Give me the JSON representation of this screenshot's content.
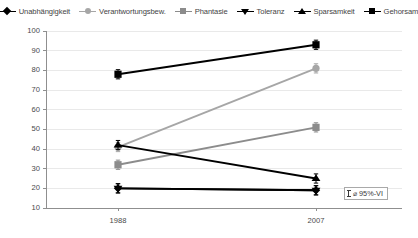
{
  "chart_data": {
    "type": "line",
    "title": "",
    "xlabel": "",
    "ylabel": "",
    "categories": [
      "1988",
      "2007"
    ],
    "ylim": [
      10,
      100
    ],
    "yticks": [
      100,
      90,
      80,
      70,
      60,
      50,
      40,
      30,
      20,
      10
    ],
    "grid": true,
    "legend_position": "top",
    "series": [
      {
        "name": "Unabhängigkeit",
        "marker": "diamond",
        "color": "#000000",
        "values": [
          20,
          19
        ]
      },
      {
        "name": "Verantwortungsbew.",
        "marker": "circle",
        "color": "#a6a6a6",
        "values": [
          41,
          81
        ]
      },
      {
        "name": "Phantasie",
        "marker": "square",
        "color": "#8c8c8c",
        "values": [
          32,
          51
        ]
      },
      {
        "name": "Toleranz",
        "marker": "triangle-down",
        "color": "#000000",
        "values": [
          20,
          19
        ]
      },
      {
        "name": "Sparsamkeit",
        "marker": "triangle-up",
        "color": "#000000",
        "values": [
          42,
          25
        ]
      },
      {
        "name": "Gehorsam",
        "marker": "square",
        "color": "#000000",
        "values": [
          78,
          93
        ]
      }
    ],
    "annotation": {
      "glyph": "I",
      "text": "⌀ 95%-VI"
    }
  },
  "legend": {
    "items": [
      {
        "label": "Unabhängigkeit"
      },
      {
        "label": "Verantwortungsbew."
      },
      {
        "label": "Phantasie"
      },
      {
        "label": "Toleranz"
      },
      {
        "label": "Sparsamkeit"
      },
      {
        "label": "Gehorsam"
      }
    ]
  },
  "axes": {
    "y_ticks": [
      "100",
      "90",
      "80",
      "70",
      "60",
      "50",
      "40",
      "30",
      "20",
      "10"
    ],
    "x_ticks": [
      "1988",
      "2007"
    ]
  },
  "note": {
    "text": "⌀ 95%-VI"
  },
  "colors": {
    "axis": "#8f8f8f",
    "grid": "#e9e9e9",
    "dark": "#000000",
    "mid_gray": "#8c8c8c",
    "light_gray": "#a6a6a6",
    "text": "#4a4a4a"
  }
}
